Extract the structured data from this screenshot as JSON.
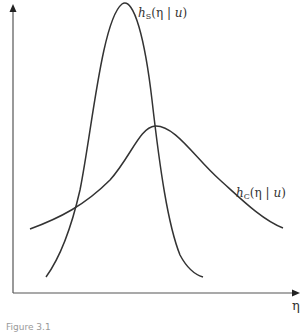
{
  "diagram": {
    "type": "density-curves",
    "axes": {
      "x_label": "η",
      "y_label": ""
    },
    "curves": [
      {
        "id": "h_S",
        "func": "h",
        "subscript": "S",
        "arg": "(η | ",
        "cond": "u",
        "close": ")",
        "shape": "narrow tall peak",
        "peak": [
          122,
          4
        ],
        "start": [
          46,
          277
        ],
        "end": [
          203,
          277
        ]
      },
      {
        "id": "h_C",
        "func": "h",
        "subscript": "C",
        "arg": "(η | ",
        "cond": "u",
        "close": ")",
        "shape": "wide low peak",
        "peak": [
          155,
          126
        ],
        "start": [
          30,
          229
        ],
        "end": [
          283,
          228
        ]
      }
    ],
    "colors": {
      "line": "#333333",
      "axis": "#444444",
      "text": "#333333"
    },
    "caption": "Figure 3.1"
  }
}
